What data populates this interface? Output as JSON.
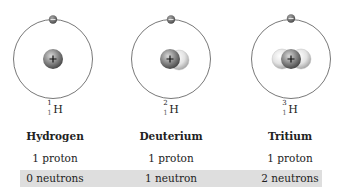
{
  "isotopes": [
    {
      "name": "Hydrogen",
      "symbol": "H",
      "mass_number": "1",
      "atomic_number": "1",
      "protons": "1 proton",
      "neutrons": "0 neutrons",
      "neutron_count": 0
    },
    {
      "name": "Deuterium",
      "symbol": "H",
      "mass_number": "2",
      "atomic_number": "1",
      "protons": "1 proton",
      "neutrons": "1 neutron",
      "neutron_count": 1
    },
    {
      "name": "Tritium",
      "symbol": "H",
      "mass_number": "3",
      "atomic_number": "1",
      "protons": "1 proton",
      "neutrons": "2 neutrons",
      "neutron_count": 2
    }
  ],
  "labels": {
    "proton_sign": "+",
    "electron_sign": "−"
  },
  "colors": {
    "orbit": "#555555",
    "proton": "#6e6e6e",
    "neutron": "#d8d8d8",
    "electron": "#5a5a5a",
    "neutron_bar": "#dedede"
  }
}
